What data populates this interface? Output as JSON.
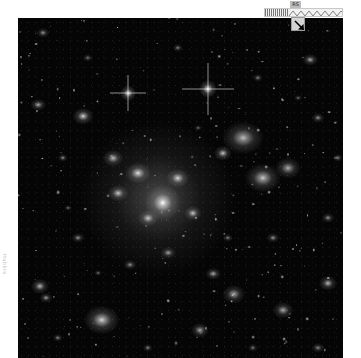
{
  "viewer": {
    "description": "Deep-field telescope image of a galaxy cluster (grayscale)",
    "background_color": "#050505",
    "sources": [
      {
        "x": 140,
        "y": 180,
        "r": 60,
        "b": 0.55,
        "type": "halo"
      },
      {
        "x": 145,
        "y": 185,
        "r": 14,
        "b": 1.0,
        "type": "core"
      },
      {
        "x": 120,
        "y": 155,
        "r": 10,
        "b": 0.9,
        "type": "galaxy"
      },
      {
        "x": 160,
        "y": 160,
        "r": 9,
        "b": 0.85,
        "type": "galaxy"
      },
      {
        "x": 130,
        "y": 200,
        "r": 8,
        "b": 0.8,
        "type": "galaxy"
      },
      {
        "x": 175,
        "y": 195,
        "r": 7,
        "b": 0.8,
        "type": "galaxy"
      },
      {
        "x": 100,
        "y": 175,
        "r": 8,
        "b": 0.8,
        "type": "galaxy"
      },
      {
        "x": 190,
        "y": 71,
        "r": 7,
        "b": 1.0,
        "type": "star"
      },
      {
        "x": 110,
        "y": 75,
        "r": 6,
        "b": 0.95,
        "type": "star"
      },
      {
        "x": 225,
        "y": 120,
        "r": 16,
        "b": 0.75,
        "type": "galaxy"
      },
      {
        "x": 245,
        "y": 160,
        "r": 14,
        "b": 0.8,
        "type": "galaxy"
      },
      {
        "x": 270,
        "y": 150,
        "r": 10,
        "b": 0.7,
        "type": "galaxy"
      },
      {
        "x": 205,
        "y": 135,
        "r": 7,
        "b": 0.8,
        "type": "galaxy"
      },
      {
        "x": 65,
        "y": 98,
        "r": 8,
        "b": 0.85,
        "type": "galaxy"
      },
      {
        "x": 20,
        "y": 87,
        "r": 6,
        "b": 0.7,
        "type": "galaxy"
      },
      {
        "x": 25,
        "y": 15,
        "r": 5,
        "b": 0.6,
        "type": "galaxy"
      },
      {
        "x": 95,
        "y": 140,
        "r": 8,
        "b": 0.75,
        "type": "galaxy"
      },
      {
        "x": 84,
        "y": 302,
        "r": 14,
        "b": 0.85,
        "type": "galaxy"
      },
      {
        "x": 22,
        "y": 268,
        "r": 7,
        "b": 0.75,
        "type": "galaxy"
      },
      {
        "x": 28,
        "y": 280,
        "r": 5,
        "b": 0.65,
        "type": "galaxy"
      },
      {
        "x": 216,
        "y": 276,
        "r": 9,
        "b": 0.7,
        "type": "galaxy"
      },
      {
        "x": 195,
        "y": 256,
        "r": 6,
        "b": 0.7,
        "type": "galaxy"
      },
      {
        "x": 182,
        "y": 312,
        "r": 7,
        "b": 0.7,
        "type": "galaxy"
      },
      {
        "x": 265,
        "y": 292,
        "r": 8,
        "b": 0.7,
        "type": "galaxy"
      },
      {
        "x": 310,
        "y": 265,
        "r": 7,
        "b": 0.75,
        "type": "galaxy"
      },
      {
        "x": 292,
        "y": 42,
        "r": 6,
        "b": 0.7,
        "type": "galaxy"
      },
      {
        "x": 300,
        "y": 100,
        "r": 5,
        "b": 0.6,
        "type": "galaxy"
      },
      {
        "x": 60,
        "y": 220,
        "r": 5,
        "b": 0.6,
        "type": "galaxy"
      },
      {
        "x": 150,
        "y": 235,
        "r": 6,
        "b": 0.65,
        "type": "galaxy"
      },
      {
        "x": 112,
        "y": 247,
        "r": 5,
        "b": 0.6,
        "type": "galaxy"
      },
      {
        "x": 45,
        "y": 140,
        "r": 4,
        "b": 0.6,
        "type": "galaxy"
      },
      {
        "x": 240,
        "y": 60,
        "r": 4,
        "b": 0.55,
        "type": "galaxy"
      },
      {
        "x": 160,
        "y": 30,
        "r": 4,
        "b": 0.55,
        "type": "galaxy"
      },
      {
        "x": 70,
        "y": 40,
        "r": 4,
        "b": 0.5,
        "type": "galaxy"
      },
      {
        "x": 310,
        "y": 200,
        "r": 5,
        "b": 0.6,
        "type": "galaxy"
      },
      {
        "x": 255,
        "y": 220,
        "r": 5,
        "b": 0.6,
        "type": "galaxy"
      },
      {
        "x": 40,
        "y": 320,
        "r": 4,
        "b": 0.55,
        "type": "galaxy"
      },
      {
        "x": 130,
        "y": 330,
        "r": 4,
        "b": 0.55,
        "type": "galaxy"
      },
      {
        "x": 300,
        "y": 330,
        "r": 5,
        "b": 0.55,
        "type": "galaxy"
      },
      {
        "x": 235,
        "y": 330,
        "r": 4,
        "b": 0.5,
        "type": "galaxy"
      },
      {
        "x": 80,
        "y": 255,
        "r": 3,
        "b": 0.5,
        "type": "galaxy"
      },
      {
        "x": 180,
        "y": 110,
        "r": 3,
        "b": 0.5,
        "type": "galaxy"
      },
      {
        "x": 280,
        "y": 80,
        "r": 3,
        "b": 0.5,
        "type": "galaxy"
      },
      {
        "x": 50,
        "y": 190,
        "r": 3,
        "b": 0.5,
        "type": "galaxy"
      },
      {
        "x": 210,
        "y": 220,
        "r": 4,
        "b": 0.55,
        "type": "galaxy"
      },
      {
        "x": 320,
        "y": 140,
        "r": 4,
        "b": 0.55,
        "type": "galaxy"
      }
    ],
    "spiked_stars": [
      {
        "x": 190,
        "y": 71,
        "len": 26
      },
      {
        "x": 110,
        "y": 75,
        "len": 18
      }
    ]
  },
  "side_label": {
    "text": "Hubble"
  },
  "toolbar": {
    "scale_badge": "RS",
    "ruler_label": "zoom-scale-ruler",
    "nav_handle_label": "pan-navigator"
  }
}
